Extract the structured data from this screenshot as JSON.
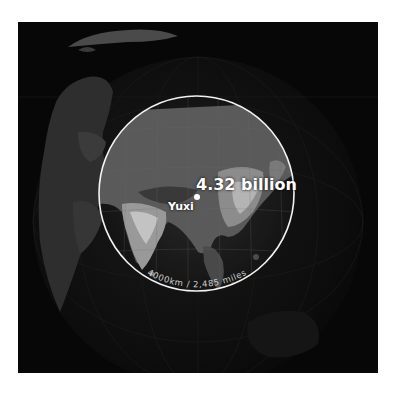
{
  "header": {
    "cropped_text": ""
  },
  "map": {
    "style": "night-lights-globe",
    "colors": {
      "background": "#070707",
      "circle_stroke": "#f2f2f2",
      "label": "#ffffff",
      "scale_label": "#cfcfcf"
    },
    "circle": {
      "center_label": "Yuxi",
      "population_label": "4.32 billion",
      "radius_label": "4000km / 2,485 miles"
    },
    "marker": {
      "name": "Yuxi",
      "icon": "circle-dot-icon"
    },
    "attribution": {
      "left": "",
      "right": ""
    }
  }
}
